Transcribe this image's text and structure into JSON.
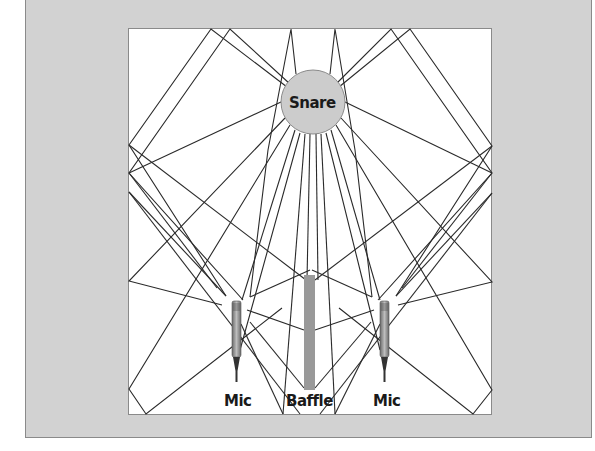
{
  "diagram": {
    "title": "",
    "labels": {
      "snare": "Snare",
      "mic_left": "Mic",
      "baffle": "Baffle",
      "mic_right": "Mic"
    },
    "colors": {
      "background_panel": "#d2d2d2",
      "room": "#ffffff",
      "snare_fill": "#cccccc",
      "baffle_fill": "#999999",
      "mic_body": "#8c8c8c",
      "ray_stroke": "#2a2a2a",
      "border": "#8a8a8a"
    },
    "elements": [
      {
        "type": "snare",
        "label": "Snare",
        "center": [
          313,
          102
        ],
        "radius": 32
      },
      {
        "type": "mic",
        "label": "Mic",
        "position": [
          235,
          300
        ]
      },
      {
        "type": "baffle",
        "label": "Baffle",
        "rect": [
          304,
          275,
          11,
          115
        ]
      },
      {
        "type": "mic",
        "label": "Mic",
        "position": [
          384,
          300
        ]
      }
    ]
  }
}
